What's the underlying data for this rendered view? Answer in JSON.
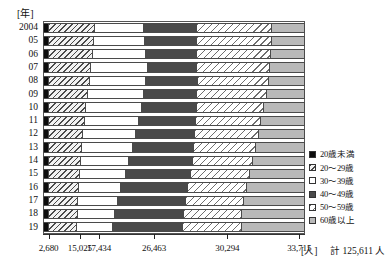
{
  "axes": {
    "y_unit_label": "[年]",
    "x_unit_label": "[人]",
    "total_label": "計 125,611 人"
  },
  "legend": {
    "items": [
      {
        "label": "20歳未満",
        "swatch": "solid-black",
        "color": "#0d0d0d"
      },
      {
        "label": "20〜29歳",
        "swatch": "hatched-dark",
        "color": "#f2f2f2"
      },
      {
        "label": "30〜39歳",
        "swatch": "empty-white",
        "color": "#ffffff"
      },
      {
        "label": "40〜49歳",
        "swatch": "solid-dark-gray",
        "color": "#4a4a4a"
      },
      {
        "label": "50〜59歳",
        "swatch": "hatched-light",
        "color": "#ffffff"
      },
      {
        "label": "60歳以上",
        "swatch": "solid-light-gray",
        "color": "#b9b9b9"
      }
    ]
  },
  "chart_data": {
    "type": "bar",
    "orientation": "horizontal",
    "stacked": "100%",
    "title": "",
    "xlabel": "[人]",
    "ylabel": "[年]",
    "grid": false,
    "legend_position": "right",
    "categories": [
      "2004",
      "05",
      "06",
      "07",
      "08",
      "09",
      "10",
      "11",
      "12",
      "13",
      "14",
      "15",
      "16",
      "17",
      "18",
      "19"
    ],
    "series": [
      {
        "name": "20歳未満",
        "values": [
          2.3,
          2.3,
          2.3,
          2.3,
          2.4,
          2.4,
          2.3,
          2.2,
          2.2,
          2.2,
          2.2,
          2.2,
          2.2,
          2.2,
          2.2,
          2.1
        ]
      },
      {
        "name": "20〜29歳",
        "values": [
          17.6,
          17.1,
          16.6,
          16.2,
          15.4,
          14.7,
          14.2,
          13.7,
          13.2,
          12.8,
          12.4,
          12.1,
          11.6,
          11.3,
          11.0,
          10.9
        ]
      },
      {
        "name": "30〜39歳",
        "values": [
          18.6,
          19.6,
          20.6,
          21.4,
          21.6,
          21.4,
          21.1,
          20.6,
          20.0,
          19.2,
          18.2,
          17.2,
          16.0,
          15.0,
          14.1,
          13.9
        ]
      },
      {
        "name": "40〜49歳",
        "values": [
          20.3,
          19.8,
          19.4,
          19.0,
          19.6,
          20.4,
          21.2,
          22.0,
          22.8,
          23.6,
          24.3,
          25.0,
          25.6,
          26.1,
          26.4,
          26.4
        ]
      },
      {
        "name": "50〜59歳",
        "values": [
          28.7,
          28.5,
          28.2,
          27.9,
          27.3,
          26.5,
          25.6,
          24.9,
          24.2,
          23.5,
          22.9,
          22.4,
          22.3,
          22.2,
          22.3,
          22.5
        ]
      },
      {
        "name": "60歳以上",
        "values": [
          12.5,
          12.7,
          12.9,
          13.2,
          13.7,
          14.6,
          15.6,
          16.6,
          17.6,
          18.7,
          20.0,
          21.1,
          22.3,
          23.2,
          24.0,
          24.2
        ]
      }
    ],
    "xtick_values": [
      2680,
      15025,
      17434,
      26463,
      30294,
      33715
    ],
    "xtick_labels": [
      "2,680",
      "15,025",
      "17,434",
      "26,463",
      "30,294",
      "33,715"
    ],
    "xtick_positions_pct": [
      2.13,
      14.1,
      21.4,
      42.4,
      70.4,
      97.8
    ],
    "annotation_total": "計 125,611 人",
    "total_people": 125611
  }
}
